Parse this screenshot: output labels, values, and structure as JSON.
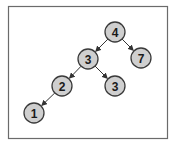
{
  "diagram": {
    "type": "binary-tree",
    "colors": {
      "frame": "#6b6b6b",
      "node_fill": "#cfcfcf",
      "node_stroke": "#3a3a3a",
      "edge": "#333333"
    },
    "nodes": [
      {
        "id": "n4",
        "label": "4",
        "x": 115,
        "y": 32
      },
      {
        "id": "n3a",
        "label": "3",
        "x": 88,
        "y": 59
      },
      {
        "id": "n7",
        "label": "7",
        "x": 141,
        "y": 58
      },
      {
        "id": "n2",
        "label": "2",
        "x": 62,
        "y": 86
      },
      {
        "id": "n3b",
        "label": "3",
        "x": 115,
        "y": 86
      },
      {
        "id": "n1",
        "label": "1",
        "x": 34,
        "y": 113
      }
    ],
    "edges": [
      {
        "from": "n4",
        "to": "n3a"
      },
      {
        "from": "n4",
        "to": "n7"
      },
      {
        "from": "n3a",
        "to": "n2"
      },
      {
        "from": "n3a",
        "to": "n3b"
      },
      {
        "from": "n2",
        "to": "n1"
      }
    ]
  }
}
